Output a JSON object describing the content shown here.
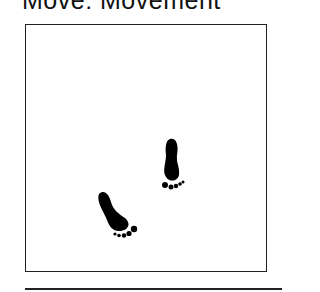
{
  "title": "Move: Movement",
  "illustration": {
    "icon": "footprints-icon",
    "footprints": [
      {
        "name": "right-footprint",
        "x": 163,
        "y": 138
      },
      {
        "name": "left-footprint",
        "x": 96,
        "y": 192
      }
    ],
    "color": "#000000"
  }
}
